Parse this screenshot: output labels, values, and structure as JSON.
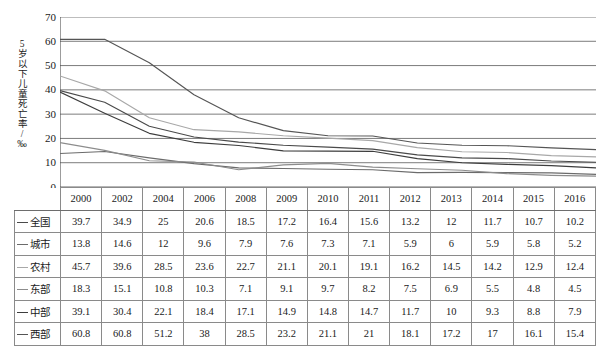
{
  "chart_data": {
    "type": "line",
    "title": "",
    "xlabel": "",
    "ylabel": "5岁以下儿童死亡率/‰",
    "ylim": [
      0,
      70
    ],
    "ytick_step": 10,
    "yticks": [
      70,
      60,
      50,
      40,
      30,
      20,
      10,
      0
    ],
    "grid": true,
    "legend_position": "table-row-labels",
    "categories": [
      "2000",
      "2002",
      "2004",
      "2006",
      "2008",
      "2009",
      "2010",
      "2011",
      "2012",
      "2013",
      "2014",
      "2015",
      "2016"
    ],
    "series": [
      {
        "name": "全国",
        "color": "#4a4a4a",
        "values": [
          39.7,
          34.9,
          25,
          20.6,
          18.5,
          17.2,
          16.4,
          15.6,
          13.2,
          12,
          11.7,
          10.7,
          10.2
        ]
      },
      {
        "name": "城市",
        "color": "#6b6b6b",
        "values": [
          13.8,
          14.6,
          12,
          9.6,
          7.9,
          7.6,
          7.3,
          7.1,
          5.9,
          6,
          5.9,
          5.8,
          5.2
        ]
      },
      {
        "name": "农村",
        "color": "#a8a8a8",
        "values": [
          45.7,
          39.6,
          28.5,
          23.6,
          22.7,
          21.1,
          20.1,
          19.1,
          16.2,
          14.5,
          14.2,
          12.9,
          12.4
        ]
      },
      {
        "name": "东部",
        "color": "#8c8c8c",
        "values": [
          18.3,
          15.1,
          10.8,
          10.3,
          7.1,
          9.1,
          9.7,
          8.2,
          7.5,
          6.9,
          5.5,
          4.8,
          4.5
        ]
      },
      {
        "name": "中部",
        "color": "#3d3d3d",
        "values": [
          39.1,
          30.4,
          22.1,
          18.4,
          17.1,
          14.9,
          14.8,
          14.7,
          11.7,
          10,
          9.3,
          8.8,
          7.9
        ]
      },
      {
        "name": "西部",
        "color": "#555555",
        "values": [
          60.8,
          60.8,
          51.2,
          38,
          28.5,
          23.2,
          21.1,
          21,
          18.1,
          17.2,
          17,
          16.1,
          15.4
        ]
      }
    ]
  },
  "table": {
    "corner_label": "",
    "headers": [
      "2000",
      "2002",
      "2004",
      "2006",
      "2008",
      "2009",
      "2010",
      "2011",
      "2012",
      "2013",
      "2014",
      "2015",
      "2016"
    ],
    "rows": [
      {
        "label": "全国",
        "values": [
          "39.7",
          "34.9",
          "25",
          "20.6",
          "18.5",
          "17.2",
          "16.4",
          "15.6",
          "13.2",
          "12",
          "11.7",
          "10.7",
          "10.2"
        ]
      },
      {
        "label": "城市",
        "values": [
          "13.8",
          "14.6",
          "12",
          "9.6",
          "7.9",
          "7.6",
          "7.3",
          "7.1",
          "5.9",
          "6",
          "5.9",
          "5.8",
          "5.2"
        ]
      },
      {
        "label": "农村",
        "values": [
          "45.7",
          "39.6",
          "28.5",
          "23.6",
          "22.7",
          "21.1",
          "20.1",
          "19.1",
          "16.2",
          "14.5",
          "14.2",
          "12.9",
          "12.4"
        ]
      },
      {
        "label": "东部",
        "values": [
          "18.3",
          "15.1",
          "10.8",
          "10.3",
          "7.1",
          "9.1",
          "9.7",
          "8.2",
          "7.5",
          "6.9",
          "5.5",
          "4.8",
          "4.5"
        ]
      },
      {
        "label": "中部",
        "values": [
          "39.1",
          "30.4",
          "22.1",
          "18.4",
          "17.1",
          "14.9",
          "14.8",
          "14.7",
          "11.7",
          "10",
          "9.3",
          "8.8",
          "7.9"
        ]
      },
      {
        "label": "西部",
        "values": [
          "60.8",
          "60.8",
          "51.2",
          "38",
          "28.5",
          "23.2",
          "21.1",
          "21",
          "18.1",
          "17.2",
          "17",
          "16.1",
          "15.4"
        ]
      }
    ]
  },
  "colors": {
    "gridline": "#6d6d6d",
    "axis": "#4a4a4a",
    "border": "#8a8a8a",
    "text": "#1a1a1a"
  }
}
